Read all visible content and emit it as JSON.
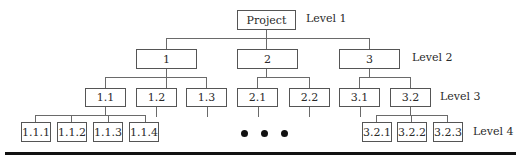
{
  "levels": [
    "Level 1",
    "Level 2",
    "Level 3",
    "Level 4"
  ],
  "root": {
    "label": "Project"
  },
  "level2": [
    {
      "label": "1"
    },
    {
      "label": "2"
    },
    {
      "label": "3"
    }
  ],
  "level3": [
    {
      "label": "1.1",
      "parent": "1"
    },
    {
      "label": "1.2",
      "parent": "1"
    },
    {
      "label": "1.3",
      "parent": "1"
    },
    {
      "label": "2.1",
      "parent": "2"
    },
    {
      "label": "2.2",
      "parent": "2"
    },
    {
      "label": "3.1",
      "parent": "3"
    },
    {
      "label": "3.2",
      "parent": "3"
    }
  ],
  "level4": [
    {
      "label": "1.1.1",
      "parent": "1.1"
    },
    {
      "label": "1.1.2",
      "parent": "1.1"
    },
    {
      "label": "1.1.3",
      "parent": "1.1"
    },
    {
      "label": "1.1.4",
      "parent": "1.1"
    },
    {
      "label": "3.2.1",
      "parent": "3.2"
    },
    {
      "label": "3.2.2",
      "parent": "3.2"
    },
    {
      "label": "3.2.3",
      "parent": "3.2"
    }
  ],
  "ellipsis": "• • •"
}
